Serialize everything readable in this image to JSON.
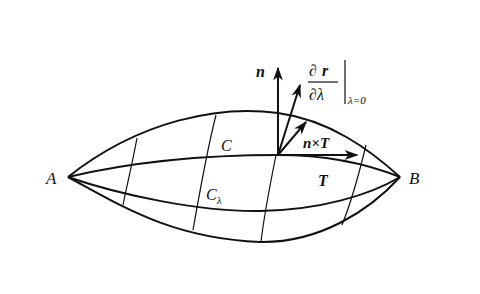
{
  "diagram": {
    "points": {
      "A": "A",
      "B": "B"
    },
    "curves": {
      "C": "C",
      "C_lambda_base": "C",
      "C_lambda_sub": "λ"
    },
    "vectors": {
      "normal": "n",
      "tangent": "T",
      "n_cross_T": "n×T",
      "variation_num_d": "∂",
      "variation_num_r": "r",
      "variation_den": "∂λ",
      "variation_eval": "λ=0"
    }
  }
}
